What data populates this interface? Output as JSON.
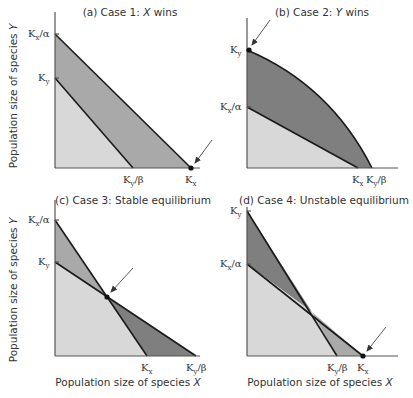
{
  "colors": {
    "light": "#d8d8d8",
    "medium": "#a9a9a9",
    "dark": "#7f7f7f",
    "line": "#1a1a1a"
  },
  "panels": {
    "a": {
      "title_prefix": "(a) Case 1: ",
      "title_var": "X",
      "title_suffix": " wins",
      "ylabel": "Population size of species ",
      "ylabel_var": "Y",
      "yticks": [
        {
          "main": "K",
          "sub": "x",
          "tail": "/α"
        },
        {
          "main": "K",
          "sub": "y",
          "tail": ""
        }
      ],
      "xticks": [
        {
          "main": "K",
          "sub": "y",
          "tail": "/β"
        },
        {
          "main": "K",
          "sub": "x",
          "tail": ""
        }
      ]
    },
    "b": {
      "title_prefix": "(b) Case 2: ",
      "title_var": "Y",
      "title_suffix": " wins",
      "yticks": [
        {
          "main": "K",
          "sub": "y",
          "tail": ""
        },
        {
          "main": "K",
          "sub": "x",
          "tail": "/α"
        }
      ],
      "xticks": [
        {
          "main": "K",
          "sub": "x",
          "tail": ""
        },
        {
          "main": "K",
          "sub": "y",
          "tail": "/β"
        }
      ]
    },
    "c": {
      "title": "(c) Case 3: Stable equilibrium",
      "ylabel": "Population size of species ",
      "ylabel_var": "Y",
      "xlabel": "Population size of species ",
      "xlabel_var": "X",
      "yticks": [
        {
          "main": "K",
          "sub": "x",
          "tail": "/α"
        },
        {
          "main": "K",
          "sub": "y",
          "tail": ""
        }
      ],
      "xticks": [
        {
          "main": "K",
          "sub": "x",
          "tail": ""
        },
        {
          "main": "K",
          "sub": "y",
          "tail": "/β"
        }
      ]
    },
    "d": {
      "title": "(d) Case 4: Unstable equilibrium",
      "xlabel": "Population size of species ",
      "xlabel_var": "X",
      "yticks": [
        {
          "main": "K",
          "sub": "y",
          "tail": ""
        },
        {
          "main": "K",
          "sub": "x",
          "tail": "/α"
        }
      ],
      "xticks": [
        {
          "main": "K",
          "sub": "y",
          "tail": "/β"
        },
        {
          "main": "K",
          "sub": "x",
          "tail": ""
        }
      ]
    }
  }
}
